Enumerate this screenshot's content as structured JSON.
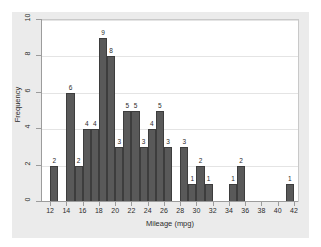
{
  "chart_data": {
    "type": "bar",
    "title": "",
    "subtitle": "",
    "xlabel": "Mileage (mpg)",
    "ylabel": "Frequency",
    "xlim": [
      11,
      42.5
    ],
    "ylim": [
      0,
      10
    ],
    "xticks": [
      12,
      14,
      16,
      18,
      20,
      22,
      24,
      26,
      28,
      30,
      32,
      34,
      36,
      38,
      40,
      42
    ],
    "yticks": [
      0,
      2,
      4,
      6,
      8,
      10
    ],
    "grid": "horizontal",
    "legend": "none",
    "bin_width": 1,
    "bar_color": "#595959",
    "categories": [
      12,
      14,
      15,
      16,
      17,
      18,
      19,
      20,
      21,
      22,
      23,
      24,
      25,
      26,
      28,
      29,
      30,
      31,
      34,
      35,
      41
    ],
    "values": [
      2,
      6,
      2,
      4,
      4,
      9,
      8,
      3,
      5,
      5,
      3,
      4,
      5,
      3,
      3,
      1,
      2,
      1,
      1,
      2,
      1
    ],
    "data_labels": [
      "2",
      "6",
      "2",
      "4",
      "4",
      "9",
      "8",
      "3",
      "5",
      "5",
      "3",
      "4",
      "5",
      "3",
      "3",
      "1",
      "2",
      "1",
      "1",
      "2",
      "1"
    ]
  },
  "axis": {
    "y_tick_labels": [
      "0",
      "2",
      "4",
      "6",
      "8",
      "10"
    ],
    "x_tick_labels": [
      "12",
      "14",
      "16",
      "18",
      "20",
      "22",
      "24",
      "26",
      "28",
      "30",
      "32",
      "34",
      "36",
      "38",
      "40",
      "42"
    ]
  },
  "colors": {
    "bar": "#595959",
    "bar_edge": "#3d3d3d",
    "plot_background": "#ffffff",
    "graph_background": "#ebebeb",
    "gridline": "#e4e4e4",
    "axis": "#9c9c9c",
    "text": "#2b2b2b"
  }
}
